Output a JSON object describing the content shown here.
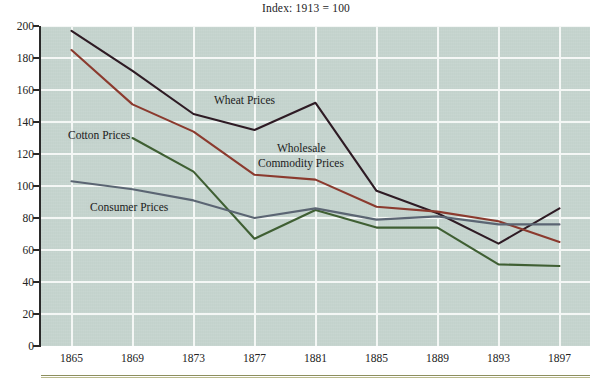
{
  "chart_data": {
    "type": "line",
    "title": "Index: 1913 = 100",
    "xlabel": "",
    "ylabel": "",
    "xlim": [
      1863,
      1899
    ],
    "ylim": [
      0,
      200
    ],
    "ytick_step": 20,
    "grid": true,
    "legend_position": "inline-annotations",
    "panel_color": "#c3d2cc",
    "gridline_color": "#f4f7f5",
    "x": [
      1865,
      1869,
      1873,
      1877,
      1881,
      1885,
      1889,
      1893,
      1897
    ],
    "categories": [
      "1865",
      "1869",
      "1873",
      "1877",
      "1881",
      "1885",
      "1889",
      "1893",
      "1897"
    ],
    "yticks": [
      0,
      20,
      40,
      60,
      80,
      100,
      120,
      140,
      160,
      180,
      200
    ],
    "ytick_labels": [
      "0",
      "20",
      "40",
      "60",
      "80",
      "100",
      "120",
      "140",
      "160",
      "180",
      "200"
    ],
    "series": [
      {
        "name": "Wheat Prices",
        "color": "#2e1b24",
        "x": [
          1865,
          1869,
          1873,
          1877,
          1881,
          1885,
          1889,
          1893,
          1897
        ],
        "values": [
          197,
          172,
          145,
          135,
          152,
          97,
          83,
          64,
          86
        ]
      },
      {
        "name": "Wholesale Commodity Prices",
        "color": "#8b3a2e",
        "x": [
          1865,
          1869,
          1873,
          1877,
          1881,
          1885,
          1889,
          1893,
          1897
        ],
        "values": [
          185,
          151,
          134,
          107,
          104,
          87,
          84,
          78,
          65
        ]
      },
      {
        "name": "Cotton Prices",
        "color": "#3f5f33",
        "x": [
          1869,
          1873,
          1877,
          1881,
          1885,
          1889,
          1893,
          1897
        ],
        "values": [
          130,
          109,
          67,
          85,
          74,
          74,
          51,
          50
        ]
      },
      {
        "name": "Consumer Prices",
        "color": "#5b6573",
        "x": [
          1865,
          1869,
          1873,
          1877,
          1881,
          1885,
          1889,
          1893,
          1897
        ],
        "values": [
          103,
          98,
          91,
          80,
          86,
          79,
          81,
          76,
          76
        ]
      }
    ],
    "annotations": [
      {
        "id": "wheat",
        "text": "Wheat Prices",
        "x_px": 214,
        "y_px": 94
      },
      {
        "id": "cotton",
        "text": "Cotton Prices",
        "x_px": 68,
        "y_px": 129
      },
      {
        "id": "wholesale_line1",
        "text": "Wholesale",
        "x_px": 277,
        "y_px": 142
      },
      {
        "id": "wholesale_line2",
        "text": "Commodity Prices",
        "x_px": 258,
        "y_px": 157
      },
      {
        "id": "consumer",
        "text": "Consumer Prices",
        "x_px": 90,
        "y_px": 201
      }
    ]
  }
}
